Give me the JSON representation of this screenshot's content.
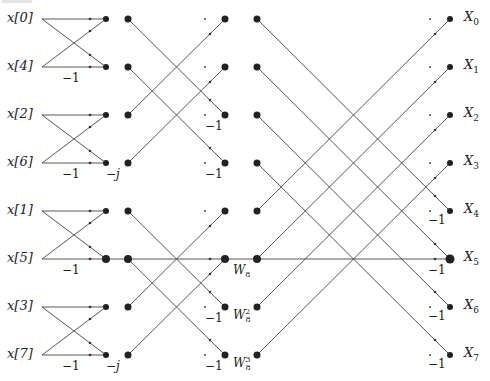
{
  "diagram": {
    "inputs": [
      {
        "label": "x[0]",
        "y": 19
      },
      {
        "label": "x[4]",
        "y": 67
      },
      {
        "label": "x[2]",
        "y": 115
      },
      {
        "label": "x[6]",
        "y": 163
      },
      {
        "label": "x[1]",
        "y": 211
      },
      {
        "label": "x[5]",
        "y": 259
      },
      {
        "label": "x[3]",
        "y": 307
      },
      {
        "label": "x[7]",
        "y": 355
      }
    ],
    "outputs": [
      {
        "base": "X",
        "sub": "0",
        "y": 19
      },
      {
        "base": "X",
        "sub": "1",
        "y": 67
      },
      {
        "base": "X",
        "sub": "2",
        "y": 115
      },
      {
        "base": "X",
        "sub": "3",
        "y": 163
      },
      {
        "base": "X",
        "sub": "4",
        "y": 211
      },
      {
        "base": "X",
        "sub": "5",
        "y": 259
      },
      {
        "base": "X",
        "sub": "6",
        "y": 307
      },
      {
        "base": "X",
        "sub": "7",
        "y": 355
      }
    ],
    "stage1_multipliers": [
      {
        "text": "−1",
        "row": 1
      },
      {
        "text": "−1",
        "row": 3
      },
      {
        "text": "−j",
        "row": 3,
        "position": "after-node"
      },
      {
        "text": "−1",
        "row": 5
      },
      {
        "text": "−1",
        "row": 7
      },
      {
        "text": "−j",
        "row": 7,
        "position": "after-node"
      }
    ],
    "stage2_multipliers": [
      {
        "text": "−1",
        "row": 2
      },
      {
        "text": "−1",
        "row": 3
      },
      {
        "text": "−1",
        "row": 6
      },
      {
        "text": "−1",
        "row": 7
      }
    ],
    "twiddles": [
      {
        "base": "W",
        "sub": "8",
        "sup": "",
        "row": 5
      },
      {
        "base": "W",
        "sub": "8",
        "sup": "2",
        "row": 6
      },
      {
        "base": "W",
        "sub": "8",
        "sup": "3",
        "row": 7
      }
    ],
    "stage3_multipliers": [
      {
        "text": "−1",
        "row": 4
      },
      {
        "text": "−1",
        "row": 5
      },
      {
        "text": "−1",
        "row": 6
      },
      {
        "text": "−1",
        "row": 7
      }
    ],
    "labels": {
      "x0": "x[0]",
      "x4": "x[4]",
      "x2": "x[2]",
      "x6": "x[6]",
      "x1": "x[1]",
      "x5": "x[5]",
      "x3": "x[3]",
      "x7": "x[7]",
      "neg_one": "−1",
      "neg_j": "−j",
      "W": "W",
      "eight": "8",
      "two": "2",
      "three": "3",
      "X": "X",
      "out": [
        "0",
        "1",
        "2",
        "3",
        "4",
        "5",
        "6",
        "7"
      ]
    },
    "colors": {
      "line": "#444444",
      "node": "#222222",
      "background": "#ffffff"
    }
  }
}
